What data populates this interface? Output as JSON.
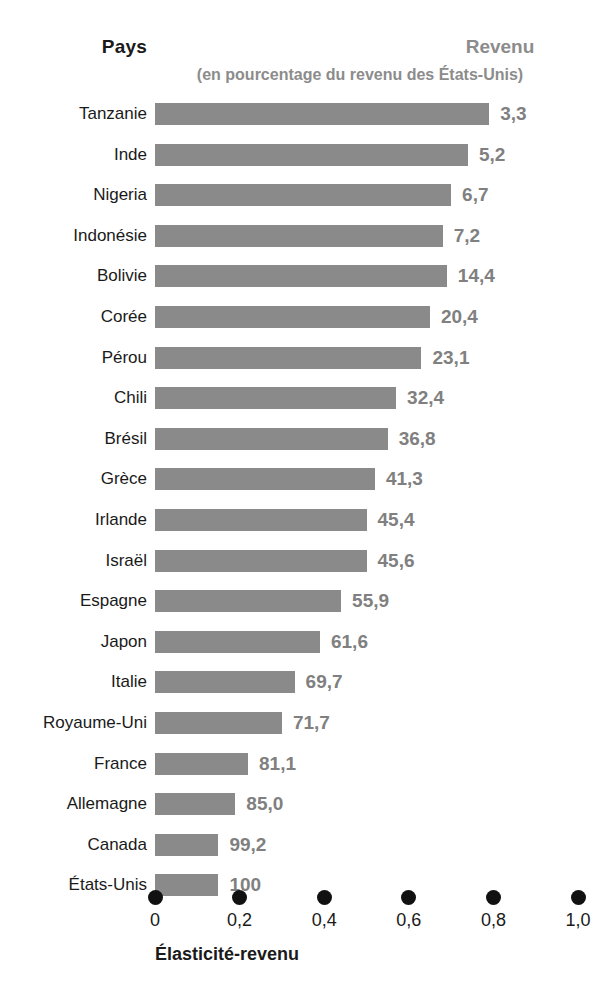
{
  "header": {
    "left_title": "Pays",
    "right_title": "Revenu",
    "subtitle": "(en pourcentage du revenu des États-Unis)"
  },
  "axis": {
    "title": "Élasticité-revenu",
    "ticks": [
      "0",
      "0,2",
      "0,4",
      "0,6",
      "0,8",
      "1,0"
    ],
    "tick_values": [
      0,
      0.2,
      0.4,
      0.6,
      0.8,
      1.0
    ],
    "range": [
      0,
      1.0
    ]
  },
  "colors": {
    "bar": "#8a8a8a",
    "value_label": "#808080",
    "header_accent": "#8c8c8c",
    "text": "#1a1a1a",
    "tick_dot": "#111111",
    "background": "#ffffff"
  },
  "chart_data": {
    "type": "bar",
    "orientation": "horizontal",
    "title": "Pays",
    "subtitle": "(en pourcentage du revenu des États-Unis)",
    "xlabel": "Élasticité-revenu",
    "ylabel": "Pays",
    "xlim": [
      0,
      1.0
    ],
    "grid": false,
    "legend": "none",
    "value_label_header": "Revenu",
    "value_label_note": "Revenu en pourcentage du revenu des États-Unis",
    "categories": [
      "Tanzanie",
      "Inde",
      "Nigeria",
      "Indonésie",
      "Bolivie",
      "Corée",
      "Pérou",
      "Chili",
      "Brésil",
      "Grèce",
      "Irlande",
      "Israël",
      "Espagne",
      "Japon",
      "Italie",
      "Royaume-Uni",
      "France",
      "Allemagne",
      "Canada",
      "États-Unis"
    ],
    "values": [
      0.79,
      0.74,
      0.7,
      0.68,
      0.69,
      0.65,
      0.63,
      0.57,
      0.55,
      0.52,
      0.5,
      0.5,
      0.44,
      0.39,
      0.33,
      0.3,
      0.22,
      0.19,
      0.15,
      0.15
    ],
    "value_labels": [
      "3,3",
      "5,2",
      "6,7",
      "7,2",
      "14,4",
      "20,4",
      "23,1",
      "32,4",
      "36,8",
      "41,3",
      "45,4",
      "45,6",
      "55,9",
      "61,6",
      "69,7",
      "71,7",
      "81,1",
      "85,0",
      "99,2",
      "100"
    ],
    "income_pct_of_us": [
      3.3,
      5.2,
      6.7,
      7.2,
      14.4,
      20.4,
      23.1,
      32.4,
      36.8,
      41.3,
      45.4,
      45.6,
      55.9,
      61.6,
      69.7,
      71.7,
      81.1,
      85.0,
      99.2,
      100
    ]
  }
}
